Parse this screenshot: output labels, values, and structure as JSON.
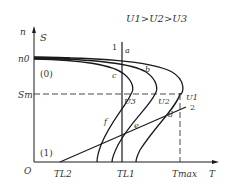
{
  "diagram": {
    "title": "U1>U2>U3",
    "axes": {
      "y_label_n": "n",
      "y_label_s": "S",
      "x_label": "T",
      "origin": "O"
    },
    "y_ticks": {
      "n0": "n0",
      "sm": "Sm"
    },
    "x_ticks": {
      "tl2": "TL2",
      "tl1": "TL1",
      "tmax": "Tmax"
    },
    "regions": {
      "zero": "(0)",
      "one": "(1)"
    },
    "lines": {
      "line1": "1",
      "line2": "2"
    },
    "curves": {
      "u1": "U1",
      "u2": "U2",
      "u3": "U3"
    },
    "points": {
      "a": "a",
      "b": "b",
      "c": "c",
      "d": "d",
      "e": "e",
      "f": "f"
    },
    "colors": {
      "ink": "#1a1a1a",
      "text": "#333333"
    }
  }
}
